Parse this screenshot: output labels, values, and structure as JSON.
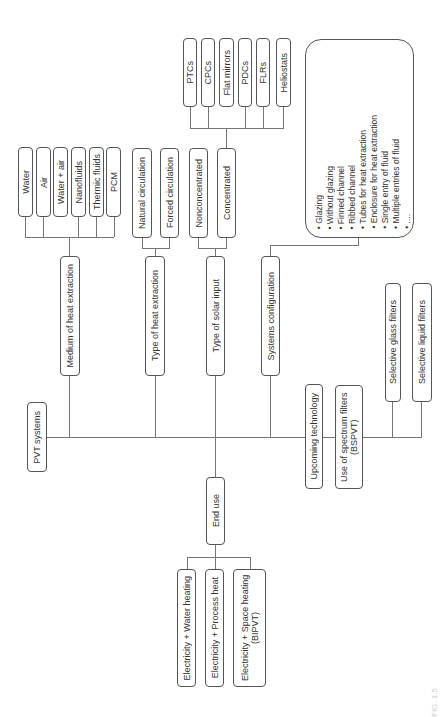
{
  "root": {
    "label": "PVT systems"
  },
  "categories": [
    {
      "id": "medium",
      "label": "Medium of heat extraction",
      "children": [
        "Water",
        "Air",
        "Water + air",
        "Nanofluids",
        "Thermic fluids",
        "PCM"
      ]
    },
    {
      "id": "heat_extraction",
      "label": "Type of heat extraction",
      "children": [
        "Natural circulation",
        "Forced circulation"
      ]
    },
    {
      "id": "solar_input",
      "label": "Type of solar input",
      "children": [
        "Nonconcentrated",
        "Concentrated"
      ],
      "concentrated_children": [
        "PTCs",
        "CPCs",
        "Flat mirrors",
        "PDCs",
        "FLRs",
        "Heliostats"
      ]
    },
    {
      "id": "config",
      "label": "Systems configuration",
      "list": [
        "Glazing",
        "Without glazing",
        "Finned channel",
        "Ribbed channel",
        "Tubes for heat extraction",
        "Enclosure for heat extraction",
        "Single entry of fluid",
        "Multiple entries of fluid",
        "...."
      ]
    },
    {
      "id": "end_use",
      "label": "End use",
      "children": [
        "Electricity + Water heating",
        "Electricity + Process heat",
        "Electricity + Space heating (BIPVT)"
      ]
    },
    {
      "id": "upcoming",
      "label": "Upcoming technology",
      "children": [
        "Use of spectrum filters (BSPVT)"
      ],
      "spectrum_children": [
        "Selective glass filters",
        "Selective liquid filters"
      ]
    }
  ],
  "caption": "FIG. 1.5"
}
